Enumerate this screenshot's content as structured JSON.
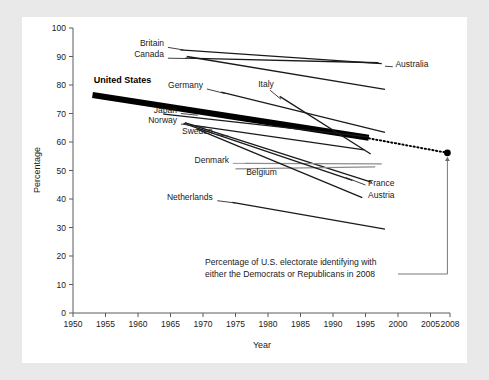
{
  "figure": {
    "background_color": "#e9e9e9",
    "panel_color": "#ffffff"
  },
  "chart_data": {
    "type": "line",
    "title": "",
    "subtitle": "",
    "xlabel": "Year",
    "ylabel": "Percentage",
    "xlim": [
      1950,
      2008
    ],
    "ylim": [
      0,
      100
    ],
    "grid": false,
    "legend_position": "inline-labels",
    "x_ticks": [
      1950,
      1955,
      1960,
      1965,
      1970,
      1975,
      1980,
      1985,
      1990,
      1995,
      2000,
      2005,
      2008
    ],
    "y_ticks": [
      0,
      10,
      20,
      30,
      40,
      50,
      60,
      70,
      80,
      90,
      100
    ],
    "series": [
      {
        "name": "Britain",
        "color": "#1a1a1a",
        "emphasis": "normal",
        "label_anchor": "end",
        "label_x": 1964.0,
        "label_y": 93.8,
        "leader": [
          [
            1964.6,
            93.2
          ],
          [
            1967.0,
            92.3
          ]
        ],
        "points": [
          [
            1966.5,
            92.3
          ],
          [
            1997.5,
            87.5
          ]
        ]
      },
      {
        "name": "Canada",
        "color": "#1a1a1a",
        "emphasis": "normal",
        "label_anchor": "end",
        "label_x": 1964.0,
        "label_y": 89.8,
        "leader": [
          [
            1964.6,
            89.4
          ],
          [
            1967.5,
            89.3
          ]
        ],
        "points": [
          [
            1967.3,
            89.4
          ],
          [
            1997.0,
            87.8
          ]
        ]
      },
      {
        "name": "Australia",
        "color": "#1a1a1a",
        "emphasis": "normal",
        "label_anchor": "start",
        "label_x": 1999.6,
        "label_y": 86.2,
        "leader": [
          [
            1998.0,
            86.6
          ],
          [
            1999.2,
            86.4
          ]
        ],
        "points": [
          [
            1967.5,
            90.0
          ],
          [
            1998.0,
            78.5
          ]
        ]
      },
      {
        "name": "United States",
        "color": "#000000",
        "emphasis": "bold",
        "label_anchor": "start",
        "label_x": 1953.2,
        "label_y": 80.6,
        "leader": null,
        "points": [
          [
            1953.0,
            76.5
          ],
          [
            1995.5,
            61.5
          ]
        ]
      },
      {
        "name": "Germany",
        "color": "#1a1a1a",
        "emphasis": "normal",
        "label_anchor": "end",
        "label_x": 1970.0,
        "label_y": 79.0,
        "leader": [
          [
            1970.6,
            78.6
          ],
          [
            1973.4,
            77.0
          ]
        ],
        "points": [
          [
            1972.8,
            77.5
          ],
          [
            1998.0,
            63.4
          ]
        ]
      },
      {
        "name": "Italy",
        "color": "#1a1a1a",
        "emphasis": "normal",
        "label_anchor": "middle",
        "label_x": 1979.7,
        "label_y": 79.2,
        "leader": [
          [
            1980.3,
            78.2
          ],
          [
            1982.0,
            75.0
          ]
        ],
        "points": [
          [
            1981.8,
            76.0
          ],
          [
            1995.8,
            55.8
          ]
        ]
      },
      {
        "name": "Japan",
        "color": "#1a1a1a",
        "emphasis": "normal",
        "label_anchor": "end",
        "label_x": 1966.0,
        "label_y": 70.2,
        "leader": [
          [
            1966.6,
            70.0
          ],
          [
            1969.2,
            69.4
          ]
        ],
        "points": [
          [
            1964.0,
            69.8
          ],
          [
            1995.5,
            61.8
          ]
        ]
      },
      {
        "name": "Norway",
        "color": "#1a1a1a",
        "emphasis": "normal",
        "label_anchor": "end",
        "label_x": 1966.0,
        "label_y": 66.5,
        "leader": [
          [
            1966.6,
            66.3
          ],
          [
            1970.4,
            65.2
          ]
        ],
        "points": [
          [
            1968.0,
            66.0
          ],
          [
            1994.8,
            57.2
          ]
        ]
      },
      {
        "name": "Sweden",
        "color": "#1a1a1a",
        "emphasis": "normal",
        "label_anchor": "end",
        "label_x": 1971.5,
        "label_y": 62.8,
        "leader": [
          [
            1972.0,
            62.6
          ],
          [
            1974.0,
            62.0
          ]
        ],
        "points": [
          [
            1967.2,
            66.8
          ],
          [
            1996.0,
            45.8
          ]
        ]
      },
      {
        "name": "Denmark",
        "color": "#8c8c8c",
        "emphasis": "normal",
        "label_anchor": "end",
        "label_x": 1974.0,
        "label_y": 52.6,
        "leader": [
          [
            1974.6,
            52.5
          ],
          [
            1977.0,
            52.5
          ]
        ],
        "points": [
          [
            1976.5,
            52.5
          ],
          [
            1997.5,
            52.3
          ]
        ]
      },
      {
        "name": "Belgium",
        "color": "#8c8c8c",
        "emphasis": "normal",
        "label_anchor": "middle",
        "label_x": 1979.0,
        "label_y": 48.5,
        "leader": null,
        "points": [
          [
            1975.0,
            50.6
          ],
          [
            1996.5,
            51.3
          ]
        ]
      },
      {
        "name": "France",
        "color": "#1a1a1a",
        "emphasis": "normal",
        "label_anchor": "start",
        "label_x": 1995.4,
        "label_y": 44.5,
        "leader": [
          [
            1992.0,
            47.5
          ],
          [
            1995.0,
            44.9
          ]
        ],
        "points": [
          [
            1967.0,
            66.5
          ],
          [
            1993.0,
            46.5
          ]
        ]
      },
      {
        "name": "Austria",
        "color": "#1a1a1a",
        "emphasis": "normal",
        "label_anchor": "start",
        "label_x": 1995.4,
        "label_y": 40.2,
        "leader": null,
        "points": [
          [
            1969.0,
            64.6
          ],
          [
            1994.5,
            40.5
          ]
        ]
      },
      {
        "name": "Netherlands",
        "color": "#1a1a1a",
        "emphasis": "normal",
        "label_anchor": "end",
        "label_x": 1971.5,
        "label_y": 39.5,
        "leader": [
          [
            1972.2,
            39.4
          ],
          [
            1975.0,
            38.6
          ]
        ],
        "points": [
          [
            1974.5,
            38.8
          ],
          [
            1998.0,
            29.4
          ]
        ]
      }
    ],
    "projection": {
      "name": "US projection to 2008",
      "style": "dotted",
      "from": [
        1995.5,
        61.3
      ],
      "to": [
        2007.6,
        56.2
      ],
      "endpoint_marker": "dot",
      "endpoint_value": 56.2,
      "endpoint_year": 2008
    },
    "annotation": {
      "line1": "Percentage of U.S. electorate identifying with",
      "line2": "either the Democrats or Republicans in 2008",
      "connector_to": [
        2007.6,
        56.2
      ]
    }
  }
}
